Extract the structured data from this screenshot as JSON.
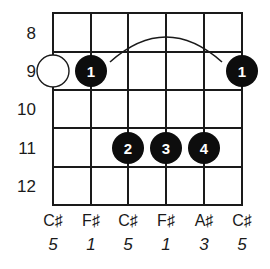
{
  "chord_diagram": {
    "frets": [
      "8",
      "9",
      "10",
      "11",
      "12"
    ],
    "strings": [
      {
        "note": "C♯",
        "interval": "5"
      },
      {
        "note": "F♯",
        "interval": "1"
      },
      {
        "note": "C♯",
        "interval": "5"
      },
      {
        "note": "F♯",
        "interval": "1"
      },
      {
        "note": "A♯",
        "interval": "3"
      },
      {
        "note": "C♯",
        "interval": "5"
      }
    ],
    "fingerings": [
      {
        "string": 1,
        "fret_row": 1,
        "finger": "",
        "type": "open-root"
      },
      {
        "string": 2,
        "fret_row": 1,
        "finger": "1",
        "type": "filled"
      },
      {
        "string": 6,
        "fret_row": 1,
        "finger": "1",
        "type": "filled"
      },
      {
        "string": 3,
        "fret_row": 3,
        "finger": "2",
        "type": "filled"
      },
      {
        "string": 4,
        "fret_row": 3,
        "finger": "3",
        "type": "filled"
      },
      {
        "string": 5,
        "fret_row": 3,
        "finger": "4",
        "type": "filled"
      }
    ],
    "barre": {
      "from_string": 2,
      "to_string": 6,
      "fret_row": 1
    },
    "colors": {
      "line": "#1a1a1a",
      "dot": "#0d0d0d",
      "dot_text": "#ffffff",
      "background": "#ffffff"
    }
  }
}
